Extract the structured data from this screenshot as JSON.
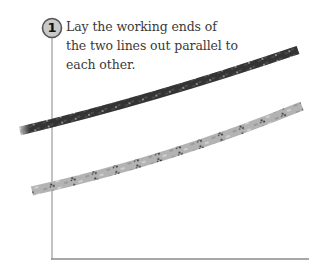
{
  "step": {
    "number": "1",
    "lines": [
      "Lay the working ends of",
      "the two lines out parallel to",
      "each other."
    ]
  },
  "ropes": [
    {
      "name": "dark-rope",
      "color": "#3c3c3c",
      "pattern": "#e8e8e8"
    },
    {
      "name": "light-rope",
      "color": "#a9a9a9",
      "pattern": "#2a2a2a"
    }
  ],
  "colors": {
    "badge_fill": "#c9c9c9",
    "badge_stroke": "#555555",
    "frame_line": "#9a9a9a"
  }
}
